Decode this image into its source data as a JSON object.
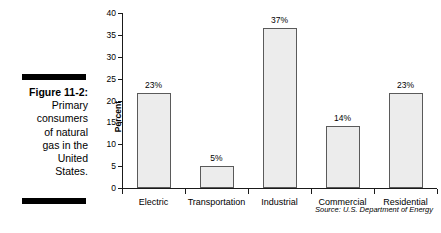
{
  "caption": {
    "figure_label": "Figure 11-2:",
    "lines": [
      "Primary",
      "consumers",
      "of natural",
      "gas in the",
      "United",
      "States."
    ],
    "rule_color": "#000000"
  },
  "chart_data": {
    "type": "bar",
    "title": "",
    "xlabel": "",
    "ylabel": "Percent",
    "categories": [
      "Electric",
      "Transportation",
      "Industrial",
      "Commercial",
      "Residential"
    ],
    "values": [
      21.7,
      5.0,
      36.5,
      14.2,
      21.7
    ],
    "data_labels": [
      "23%",
      "5%",
      "37%",
      "14%",
      "23%"
    ],
    "ylim": [
      0,
      40
    ],
    "yticks": [
      0,
      5,
      10,
      15,
      20,
      25,
      30,
      35,
      40
    ],
    "ytick_labels": [
      "0",
      "5",
      "10",
      "15",
      "20",
      "25",
      "30",
      "35",
      "40"
    ],
    "grid": false,
    "legend": false,
    "bar_fill": "#ececec",
    "bar_edge": "#5a5a5a",
    "axis_color": "#1a1a1a",
    "source": "Source: U.S. Department of Energy"
  }
}
